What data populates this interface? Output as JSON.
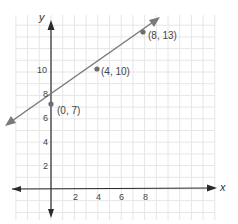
{
  "chart_data": {
    "type": "line",
    "title": "",
    "xlabel": "x",
    "ylabel": "y",
    "xlim": [
      -3,
      14
    ],
    "ylim": [
      -2,
      15
    ],
    "grid": true,
    "x_ticks": [
      2,
      4,
      6,
      8
    ],
    "y_ticks": [
      2,
      4,
      6,
      8,
      10
    ],
    "series": [
      {
        "name": "line",
        "equation": "y = 0.75x + 7",
        "x": [
          0,
          4,
          8
        ],
        "y": [
          7,
          10,
          13
        ],
        "arrows_both_ends": true
      }
    ],
    "points": [
      {
        "x": 0,
        "y": 7,
        "label": "(0, 7)"
      },
      {
        "x": 4,
        "y": 10,
        "label": "(4, 10)"
      },
      {
        "x": 8,
        "y": 13,
        "label": "(8, 13)"
      }
    ],
    "colors": {
      "line": "#7a7a7a",
      "point": "#6e6e6e",
      "axis": "#222222",
      "grid": "#e4e4e4"
    }
  },
  "labels": {
    "x_axis": "x",
    "y_axis": "y",
    "x_ticks": [
      "2",
      "4",
      "6",
      "8"
    ],
    "y_ticks": [
      "2",
      "4",
      "6",
      "8",
      "10"
    ],
    "points": [
      "(0, 7)",
      "(4, 10)",
      "(8, 13)"
    ]
  }
}
